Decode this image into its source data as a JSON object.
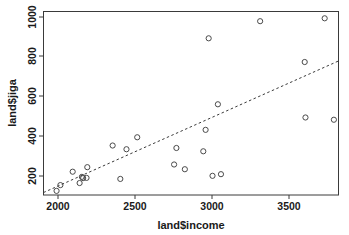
{
  "chart_data": {
    "type": "scatter",
    "title": "",
    "xlabel": "land$income",
    "ylabel": "land$jiga",
    "xlim": [
      1900,
      3820
    ],
    "ylim": [
      140,
      1030
    ],
    "xticks": [
      2000,
      2500,
      3000,
      3500
    ],
    "yticks": [
      200,
      400,
      600,
      800,
      1000
    ],
    "xtick_labels": [
      "2000",
      "2500",
      "3000",
      "3500"
    ],
    "ytick_labels": [
      "200",
      "400",
      "600",
      "800",
      "1000"
    ],
    "grid": false,
    "legend": "none",
    "marker": "open-circle",
    "points": [
      {
        "x": 1985,
        "y": 160
      },
      {
        "x": 2010,
        "y": 188
      },
      {
        "x": 2090,
        "y": 253
      },
      {
        "x": 2135,
        "y": 198
      },
      {
        "x": 2150,
        "y": 228
      },
      {
        "x": 2158,
        "y": 222
      },
      {
        "x": 2180,
        "y": 223
      },
      {
        "x": 2185,
        "y": 275
      },
      {
        "x": 2350,
        "y": 380
      },
      {
        "x": 2400,
        "y": 218
      },
      {
        "x": 2440,
        "y": 362
      },
      {
        "x": 2510,
        "y": 420
      },
      {
        "x": 2750,
        "y": 288
      },
      {
        "x": 2765,
        "y": 368
      },
      {
        "x": 2820,
        "y": 265
      },
      {
        "x": 2940,
        "y": 352
      },
      {
        "x": 2955,
        "y": 456
      },
      {
        "x": 2975,
        "y": 900
      },
      {
        "x": 3000,
        "y": 233
      },
      {
        "x": 3035,
        "y": 580
      },
      {
        "x": 3055,
        "y": 241
      },
      {
        "x": 3310,
        "y": 983
      },
      {
        "x": 3600,
        "y": 785
      },
      {
        "x": 3605,
        "y": 516
      },
      {
        "x": 3730,
        "y": 997
      },
      {
        "x": 3790,
        "y": 505
      }
    ],
    "fit_line": {
      "style": "dashed",
      "x_start": 1900,
      "y_start": 152,
      "x_end": 3820,
      "y_end": 790
    }
  },
  "annotations": {
    "y_axis_label_rotation": "vertical",
    "tick_label_rotation_y": "vertical"
  }
}
